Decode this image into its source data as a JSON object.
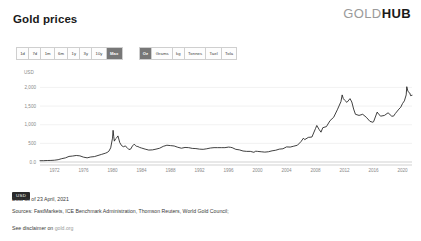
{
  "header": {
    "title": "Gold prices",
    "brand_primary": "GOLD",
    "brand_secondary": "HUB"
  },
  "controls": {
    "range_buttons": [
      {
        "label": "1d",
        "active": false
      },
      {
        "label": "7d",
        "active": false
      },
      {
        "label": "1m",
        "active": false
      },
      {
        "label": "6m",
        "active": false
      },
      {
        "label": "1y",
        "active": false
      },
      {
        "label": "3y",
        "active": false
      },
      {
        "label": "10y",
        "active": false
      },
      {
        "label": "Max",
        "active": true
      }
    ],
    "unit_buttons": [
      {
        "label": "Oz",
        "active": true
      },
      {
        "label": "Grams",
        "active": false
      },
      {
        "label": "kg",
        "active": false
      },
      {
        "label": "Tonnes",
        "active": false
      },
      {
        "label": "Tael",
        "active": false
      },
      {
        "label": "Tola",
        "active": false
      }
    ]
  },
  "legend": {
    "currency_badge": "USD"
  },
  "footer": {
    "data_as_of": "Data as of 23 April, 2021",
    "sources": "Sources: FastMarkets, ICE Benchmark Administration, Thomson Reuters, World Gold Council;",
    "disclaimer_prefix": "See disclaimer on ",
    "disclaimer_link": "gold.org"
  },
  "chart_data": {
    "type": "line",
    "title": "Gold prices",
    "xlabel": "",
    "ylabel": "USD",
    "unit_label": "USD",
    "grid": true,
    "legend_position": "below-left",
    "xlim": [
      1970,
      2021.3
    ],
    "ylim": [
      0,
      2200
    ],
    "yticks": [
      0,
      500,
      1000,
      1500,
      2000
    ],
    "ytick_labels": [
      "0.0",
      "500",
      "1,000",
      "1,500",
      "2,000"
    ],
    "xticks": [
      1972,
      1976,
      1980,
      1984,
      1988,
      1992,
      1996,
      2000,
      2004,
      2008,
      2012,
      2016,
      2020
    ],
    "xtick_labels": [
      "1972",
      "1976",
      "1980",
      "1984",
      "1988",
      "1992",
      "1996",
      "2000",
      "2004",
      "2008",
      "2012",
      "2016",
      "2020"
    ],
    "series": [
      {
        "name": "USD",
        "color": "#1f1f1f",
        "x": [
          1970.0,
          1970.5,
          1971.0,
          1971.5,
          1972.0,
          1972.5,
          1973.0,
          1973.5,
          1974.0,
          1974.5,
          1975.0,
          1975.5,
          1976.0,
          1976.5,
          1977.0,
          1977.5,
          1978.0,
          1978.5,
          1979.0,
          1979.25,
          1979.5,
          1979.75,
          1980.0,
          1980.08,
          1980.17,
          1980.25,
          1980.42,
          1980.58,
          1980.75,
          1981.0,
          1981.25,
          1981.5,
          1981.75,
          1982.0,
          1982.25,
          1982.5,
          1982.75,
          1983.0,
          1983.17,
          1983.33,
          1983.5,
          1983.75,
          1984.0,
          1984.5,
          1985.0,
          1985.5,
          1986.0,
          1986.5,
          1987.0,
          1987.5,
          1988.0,
          1988.5,
          1989.0,
          1989.5,
          1990.0,
          1990.5,
          1991.0,
          1991.5,
          1992.0,
          1992.5,
          1993.0,
          1993.5,
          1994.0,
          1994.5,
          1995.0,
          1995.5,
          1996.0,
          1996.25,
          1996.5,
          1997.0,
          1997.5,
          1998.0,
          1998.5,
          1999.0,
          1999.5,
          1999.75,
          2000.0,
          2000.5,
          2001.0,
          2001.5,
          2002.0,
          2002.5,
          2003.0,
          2003.5,
          2004.0,
          2004.5,
          2005.0,
          2005.5,
          2006.0,
          2006.33,
          2006.5,
          2007.0,
          2007.5,
          2008.0,
          2008.17,
          2008.5,
          2008.75,
          2009.0,
          2009.5,
          2010.0,
          2010.5,
          2011.0,
          2011.5,
          2011.67,
          2011.83,
          2012.0,
          2012.33,
          2012.75,
          2013.0,
          2013.25,
          2013.5,
          2014.0,
          2014.5,
          2015.0,
          2015.5,
          2015.92,
          2016.0,
          2016.5,
          2016.75,
          2017.0,
          2017.5,
          2018.0,
          2018.5,
          2018.75,
          2019.0,
          2019.5,
          2019.75,
          2020.0,
          2020.25,
          2020.5,
          2020.58,
          2020.75,
          2021.0,
          2021.1,
          2021.3
        ],
        "y": [
          35,
          36,
          40,
          42,
          48,
          62,
          90,
          110,
          150,
          160,
          175,
          165,
          130,
          112,
          135,
          145,
          175,
          205,
          235,
          255,
          290,
          380,
          640,
          850,
          680,
          560,
          620,
          650,
          700,
          520,
          440,
          410,
          430,
          390,
          335,
          345,
          430,
          480,
          440,
          420,
          415,
          390,
          375,
          345,
          320,
          325,
          345,
          370,
          420,
          450,
          440,
          430,
          395,
          370,
          390,
          385,
          365,
          360,
          345,
          340,
          355,
          375,
          385,
          385,
          385,
          385,
          400,
          395,
          385,
          340,
          325,
          295,
          285,
          285,
          260,
          290,
          285,
          275,
          265,
          275,
          300,
          315,
          345,
          355,
          405,
          400,
          425,
          450,
          550,
          640,
          600,
          660,
          670,
          900,
          980,
          870,
          800,
          920,
          950,
          1110,
          1200,
          1400,
          1620,
          1800,
          1700,
          1660,
          1600,
          1700,
          1610,
          1420,
          1280,
          1250,
          1280,
          1200,
          1090,
          1065,
          1080,
          1340,
          1270,
          1230,
          1250,
          1320,
          1230,
          1230,
          1300,
          1420,
          1470,
          1570,
          1640,
          1800,
          2020,
          1890,
          1850,
          1780,
          1790
        ]
      }
    ]
  }
}
